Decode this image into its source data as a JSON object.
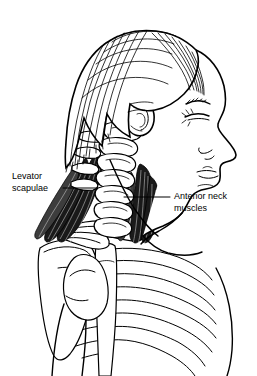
{
  "figure": {
    "background_color": "#ffffff",
    "ink_color": "#000000",
    "muscle_fill_color": "#1a1a1a",
    "width": 257,
    "height": 376
  },
  "labels": {
    "left": {
      "line1": "Levator",
      "line2": "scapulae",
      "name": "levator-scapulae-label"
    },
    "right": {
      "line1": "Anterior neck",
      "line2": "muscles",
      "name": "anterior-neck-muscles-label"
    }
  },
  "structures": {
    "head": "head-profile",
    "hair": "hair",
    "ear": "ear",
    "eye": "eye",
    "eyebrow": "eyebrow",
    "nose": "nose",
    "lips": "lips",
    "chin": "chin",
    "cervical_spine": "cervical-vertebrae",
    "clavicle": "clavicle",
    "scapula": "scapula",
    "humerus": "humerus-head",
    "sternum": "sternum",
    "ribs": "rib-cage",
    "levator_scapulae_muscle": "levator-scapulae-muscle",
    "anterior_neck_muscle": "anterior-neck-muscle"
  }
}
